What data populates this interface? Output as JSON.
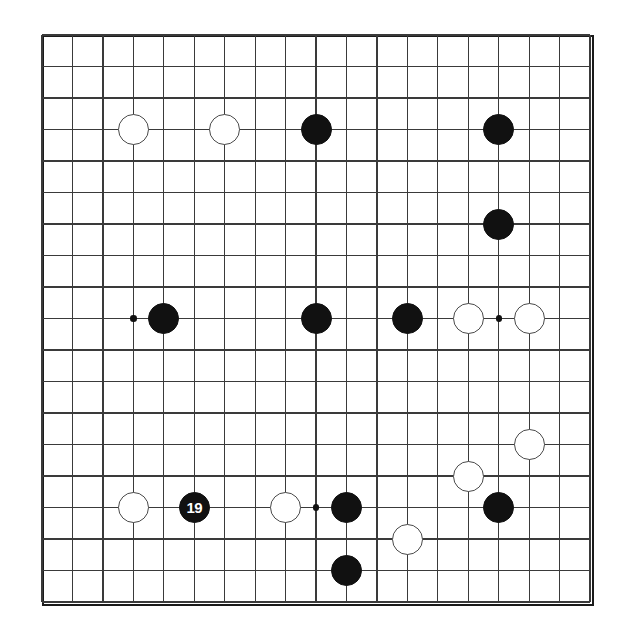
{
  "diagram": {
    "type": "go-board",
    "board_size": 19,
    "colors": {
      "black_stone": "#111111",
      "white_stone": "#ffffff",
      "white_stone_outline": "#4a4a4a",
      "grid_line": "#3a3a3a",
      "border": "#1b1b1b",
      "background": "#ffffff",
      "label_on_black": "#ffffff"
    },
    "geometry": {
      "origin_x": 11,
      "origin_y": 11,
      "cell_width": 30.45,
      "cell_height": 31.5,
      "stone_diameter": 31,
      "hoshi_diameter": 6.5
    },
    "hoshi_points": [
      {
        "col": 3,
        "row": 9
      },
      {
        "col": 15,
        "row": 9
      },
      {
        "col": 9,
        "row": 15
      }
    ],
    "stones": [
      {
        "id": "w-c3-r3",
        "color": "white",
        "col": 3,
        "row": 3,
        "label": ""
      },
      {
        "id": "w-c6-r3",
        "color": "white",
        "col": 6,
        "row": 3,
        "label": ""
      },
      {
        "id": "b-c9-r3",
        "color": "black",
        "col": 9,
        "row": 3,
        "label": ""
      },
      {
        "id": "b-c15-r3",
        "color": "black",
        "col": 15,
        "row": 3,
        "label": ""
      },
      {
        "id": "b-c15-r6",
        "color": "black",
        "col": 15,
        "row": 6,
        "label": ""
      },
      {
        "id": "b-c4-r9",
        "color": "black",
        "col": 4,
        "row": 9,
        "label": ""
      },
      {
        "id": "b-c9-r9",
        "color": "black",
        "col": 9,
        "row": 9,
        "label": ""
      },
      {
        "id": "b-c12-r9",
        "color": "black",
        "col": 12,
        "row": 9,
        "label": ""
      },
      {
        "id": "w-c14-r9",
        "color": "white",
        "col": 14,
        "row": 9,
        "label": ""
      },
      {
        "id": "w-c16-r9",
        "color": "white",
        "col": 16,
        "row": 9,
        "label": ""
      },
      {
        "id": "w-c16-r13",
        "color": "white",
        "col": 16,
        "row": 13,
        "label": ""
      },
      {
        "id": "w-c14-r14",
        "color": "white",
        "col": 14,
        "row": 14,
        "label": ""
      },
      {
        "id": "w-c3-r15",
        "color": "white",
        "col": 3,
        "row": 15,
        "label": ""
      },
      {
        "id": "b-c5-r15",
        "color": "black",
        "col": 5,
        "row": 15,
        "label": "19"
      },
      {
        "id": "w-c8-r15",
        "color": "white",
        "col": 8,
        "row": 15,
        "label": ""
      },
      {
        "id": "b-c10-r15",
        "color": "black",
        "col": 10,
        "row": 15,
        "label": ""
      },
      {
        "id": "b-c15-r15",
        "color": "black",
        "col": 15,
        "row": 15,
        "label": ""
      },
      {
        "id": "w-c12-r16",
        "color": "white",
        "col": 12,
        "row": 16,
        "label": ""
      },
      {
        "id": "b-c10-r17",
        "color": "black",
        "col": 10,
        "row": 17,
        "label": ""
      }
    ],
    "move_markers": [
      {
        "number": "19",
        "col": 5,
        "row": 15,
        "color": "black"
      }
    ]
  }
}
